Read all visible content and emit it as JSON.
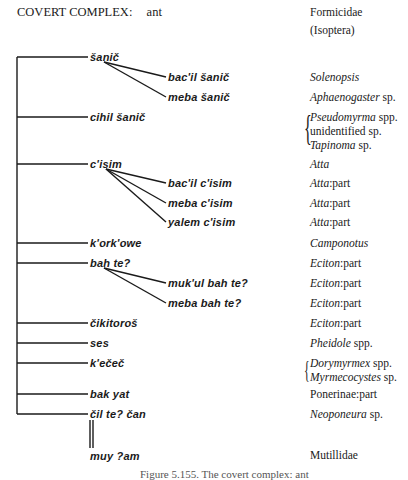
{
  "header": {
    "title": "COVERT COMPLEX:",
    "subject": "ant",
    "taxon": "Formicidae",
    "taxon_note": "(Isoptera)"
  },
  "tree": [
    {
      "term": "šanič",
      "level": 1,
      "gloss": "",
      "y": 57
    },
    {
      "term": "bac'il šanič",
      "level": 2,
      "gloss_italic": "Solenopsis",
      "gloss_plain": "",
      "y": 77
    },
    {
      "term": "meba šanič",
      "level": 2,
      "gloss_italic": "Aphaenogaster",
      "gloss_plain": " sp.",
      "y": 97
    },
    {
      "term": "cihil šanič",
      "level": 1,
      "y": 117
    },
    {
      "term": "c'isim",
      "level": 1,
      "gloss_italic": "Atta",
      "gloss_plain": "",
      "y": 164
    },
    {
      "term": "bac'il c'isim",
      "level": 2,
      "gloss_italic": "Atta",
      "gloss_plain": ":part",
      "y": 183
    },
    {
      "term": "meba c'isim",
      "level": 2,
      "gloss_italic": "Atta",
      "gloss_plain": ":part",
      "y": 203
    },
    {
      "term": "yalem c'isim",
      "level": 2,
      "gloss_italic": "Atta",
      "gloss_plain": ":part",
      "y": 222
    },
    {
      "term": "k'ork'owe",
      "level": 1,
      "gloss_italic": "Camponotus",
      "gloss_plain": "",
      "y": 243
    },
    {
      "term": "bah te?",
      "level": 1,
      "gloss_italic": "Eciton",
      "gloss_plain": ":part",
      "y": 263
    },
    {
      "term": "muk'ul bah te?",
      "level": 2,
      "gloss_italic": "Eciton",
      "gloss_plain": ":part",
      "y": 283
    },
    {
      "term": "meba bah te?",
      "level": 2,
      "gloss_italic": "Eciton",
      "gloss_plain": ":part",
      "y": 303
    },
    {
      "term": "čikitoroš",
      "level": 1,
      "gloss_italic": "Eciton",
      "gloss_plain": ":part",
      "y": 323
    },
    {
      "term": "ses",
      "level": 1,
      "gloss_italic": "Pheidole",
      "gloss_plain": " spp.",
      "y": 343
    },
    {
      "term": "k'ečeč",
      "level": 1,
      "y": 363
    },
    {
      "term": "bak yat",
      "level": 1,
      "gloss_italic": "",
      "gloss_plain": "Ponerinae:part",
      "y": 394
    },
    {
      "term": "čil te? čan",
      "level": 1,
      "gloss_italic": "Neoponeura",
      "gloss_plain": " sp.",
      "y": 414
    },
    {
      "term": "muy ?am",
      "level": 1,
      "gloss_italic": "",
      "gloss_plain": "Mutillidae",
      "y": 456
    }
  ],
  "groups": {
    "cihil_sanic": [
      {
        "italic": "Pseudomyrma",
        "plain": " spp."
      },
      {
        "italic": "",
        "plain": "unidentified sp."
      },
      {
        "italic": "Tapinoma",
        "plain": " sp."
      }
    ],
    "kecec": [
      {
        "italic": "Dorymyrmex",
        "plain": " spp."
      },
      {
        "italic": "Myrmecocystes",
        "plain": " sp."
      }
    ]
  },
  "caption": "Figure 5.155. The covert complex: ant"
}
